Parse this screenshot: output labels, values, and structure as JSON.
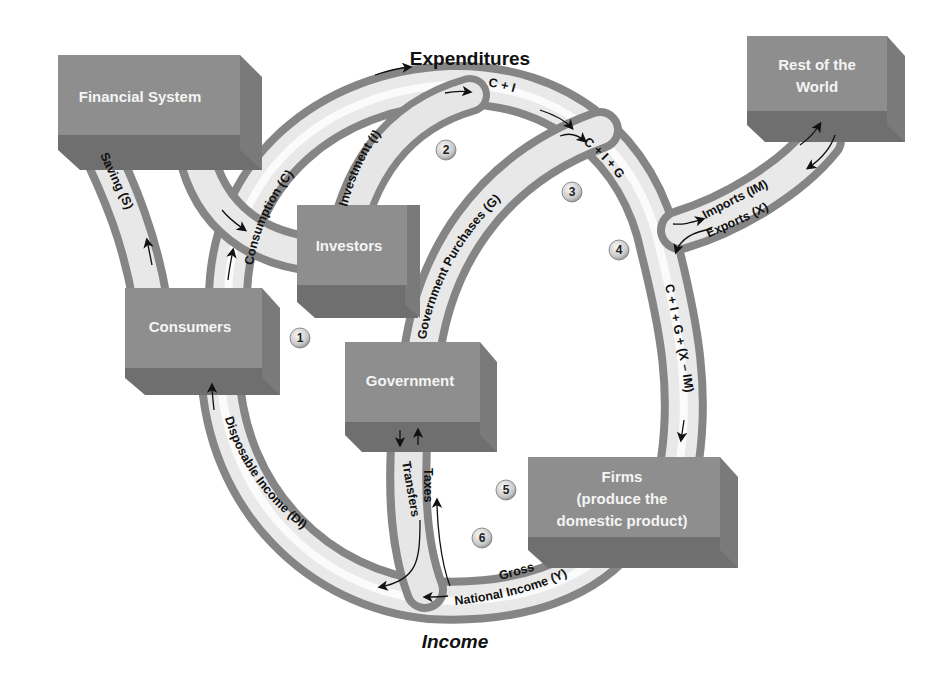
{
  "titles": {
    "top": "Expenditures",
    "bottom": "Income"
  },
  "boxes": {
    "financial_system": "Financial System",
    "rest_of_world_line1": "Rest of the",
    "rest_of_world_line2": "World",
    "investors": "Investors",
    "consumers": "Consumers",
    "government": "Government",
    "firms_line1": "Firms",
    "firms_line2": "(produce the",
    "firms_line3": "domestic product)"
  },
  "flows": {
    "saving": "Saving (S)",
    "consumption": "Consumption (C)",
    "investment": "Investment (I)",
    "c_plus_i": "C + I",
    "government_purchases": "Government Purchases (G)",
    "c_i_g": "C + I + G",
    "imports": "Imports (IM)",
    "exports": "Exports (X)",
    "c_i_g_nx": "C + I + G + (X – IM)",
    "gross": "Gross",
    "national_income": "National Income (Y)",
    "taxes": "Taxes",
    "transfers": "Transfers",
    "disposable_income": "Disposable Income (DI)"
  },
  "markers": [
    "1",
    "2",
    "3",
    "4",
    "5",
    "6"
  ],
  "colors": {
    "box_face": "#8e8e8e",
    "box_bottom": "#6f6f6f",
    "box_side": "#7a7a7a",
    "pipe_light": "#f2f2f2",
    "pipe_dark": "#8a8a8a",
    "text": "#111111"
  }
}
